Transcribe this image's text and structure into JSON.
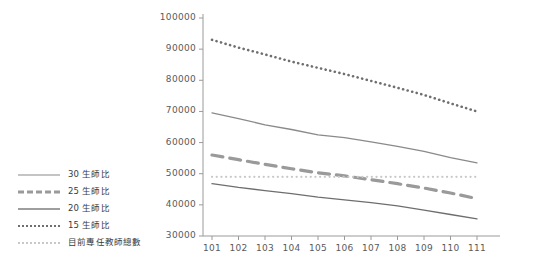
{
  "chart_data": {
    "type": "line",
    "title": "",
    "xlabel": "",
    "ylabel": "",
    "x": [
      101,
      102,
      103,
      104,
      105,
      106,
      107,
      108,
      109,
      110,
      111
    ],
    "xtick_labels": [
      "101",
      "102",
      "103",
      "104",
      "105",
      "106",
      "107",
      "108",
      "109",
      "110",
      "111"
    ],
    "ytick_labels": [
      "30000",
      "40000",
      "50000",
      "60000",
      "70000",
      "80000",
      "90000",
      "100000"
    ],
    "yticks": [
      30000,
      40000,
      50000,
      60000,
      70000,
      80000,
      90000,
      100000
    ],
    "ylim": [
      30000,
      100000
    ],
    "grid": false,
    "legend_position": "left-outside",
    "series": [
      {
        "name": "30 生師比",
        "style": "solid",
        "color": "#8a8a8a",
        "width": 1.3,
        "values": [
          69500,
          67700,
          65700,
          64200,
          62500,
          61600,
          60200,
          58800,
          57200,
          55200,
          53500
        ]
      },
      {
        "name": "25 生師比",
        "style": "dashed",
        "color": "#9a9a9a",
        "width": 3.2,
        "values": [
          56000,
          54500,
          53000,
          51600,
          50300,
          49300,
          48100,
          46800,
          45400,
          43800,
          42000
        ]
      },
      {
        "name": "20 生師比",
        "style": "solid",
        "color": "#6e6e6e",
        "width": 1.3,
        "values": [
          46800,
          45600,
          44600,
          43600,
          42500,
          41600,
          40700,
          39700,
          38300,
          36900,
          35500
        ]
      },
      {
        "name": "15 生師比",
        "style": "dotted",
        "color": "#6f6f6f",
        "width": 2.6,
        "values": [
          93000,
          90500,
          88300,
          86000,
          84000,
          82000,
          79800,
          77600,
          75300,
          72600,
          70000
        ]
      },
      {
        "name": "目前專任教師總數",
        "style": "dotted",
        "color": "#c8c8c8",
        "width": 2.2,
        "values": [
          49000,
          49000,
          49000,
          49000,
          49000,
          49000,
          49000,
          49000,
          49000,
          49000,
          49000
        ]
      }
    ]
  },
  "legend": {
    "items": [
      {
        "label": "30 生師比",
        "key_class": "k-solid-30"
      },
      {
        "label": "25 生師比",
        "key_class": "k-dash-25"
      },
      {
        "label": "20 生師比",
        "key_class": "k-solid-20"
      },
      {
        "label": "15 生師比",
        "key_class": "k-dot-15"
      },
      {
        "label": "目前專任教師總數",
        "key_class": "k-dot-tot"
      }
    ]
  },
  "axis": {
    "axis_color": "#9a9a9a",
    "tick_color": "#9a9a9a",
    "label_color": "#5a5a5a"
  }
}
